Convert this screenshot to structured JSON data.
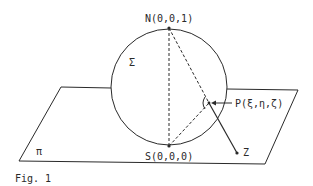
{
  "figure": {
    "caption": "Fig. 1",
    "sphere_label": "Σ",
    "plane_label": "π",
    "points": {
      "north": {
        "label": "N(0,0,1)"
      },
      "south": {
        "label": "S(0,0,0)"
      },
      "p": {
        "label": "P(ξ,η,ζ)"
      },
      "z": {
        "label": "Z"
      }
    },
    "right_angle_mark": "(·"
  },
  "colors": {
    "stroke": "#2a2a2a",
    "background": "#ffffff"
  }
}
